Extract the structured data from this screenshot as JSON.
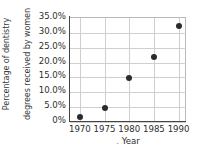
{
  "chart_data": {
    "type": "scatter",
    "title": "",
    "xlabel": ". Year",
    "xlabel_text": "Year",
    "ylabel": "Percentage of dentistry degrees received by women",
    "ylabel_lines": [
      "Percentage of dentistry",
      "degrees received by women"
    ],
    "x": [
      1970,
      1975,
      1980,
      1985,
      1990
    ],
    "values": [
      1.5,
      4.5,
      14.5,
      21.5,
      32.0
    ],
    "points": [
      {
        "x": 1970,
        "y": 1.5,
        "label": "1970"
      },
      {
        "x": 1975,
        "y": 4.5,
        "label": "1975"
      },
      {
        "x": 1980,
        "y": 14.5,
        "label": "1980"
      },
      {
        "x": 1985,
        "y": 21.5,
        "label": "1985"
      },
      {
        "x": 1990,
        "y": 32.0,
        "label": "1990"
      }
    ],
    "xticks": [
      "1970",
      "1975",
      "1980",
      "1985",
      "1990"
    ],
    "xtick_values": [
      1970,
      1975,
      1980,
      1985,
      1990
    ],
    "yticks": [
      "0%",
      "5.0%",
      "10.0%",
      "15.0%",
      "20.0%",
      "25.0%",
      "30.0%",
      "35.0%"
    ],
    "ytick_values": [
      0,
      5,
      10,
      15,
      20,
      25,
      30,
      35
    ],
    "xlim": [
      1968,
      1991.5
    ],
    "ylim": [
      0,
      35
    ],
    "grid": true,
    "legend": false,
    "marker_color": "#2b2b2b",
    "grid_color": "#cfcfcf",
    "axis_color": "#444444",
    "background": "#ffffff"
  }
}
